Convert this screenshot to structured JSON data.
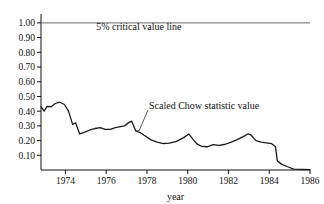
{
  "chart_data": {
    "type": "line",
    "title": "",
    "xlabel": "year",
    "ylabel": "",
    "xlim": [
      1972.8,
      1986.0
    ],
    "ylim": [
      0.0,
      1.04
    ],
    "grid": false,
    "legend_position": "none",
    "xticks": [
      "1974",
      "1976",
      "1978",
      "1980",
      "1982",
      "1984",
      "1986"
    ],
    "xtick_values": [
      1974,
      1976,
      1978,
      1980,
      1982,
      1984,
      1986
    ],
    "yticks": [
      "1.00",
      "0.90",
      "0.80",
      "0.70",
      "0.60",
      "0.50",
      "0.40",
      "0.30",
      "0.20",
      "0.10"
    ],
    "ytick_values": [
      1.0,
      0.9,
      0.8,
      0.7,
      0.6,
      0.5,
      0.4,
      0.3,
      0.2,
      0.1
    ],
    "annotations": [
      {
        "name": "critical-value-annotation",
        "text": "5% critical value line",
        "x": 1977.6,
        "y": 0.955
      },
      {
        "name": "chow-statistic-annotation",
        "text": "Scaled Chow statistic value",
        "x": 1978.1,
        "y": 0.415
      }
    ],
    "series": [
      {
        "name": "5% critical value line",
        "style": "reference",
        "constant_value": 1.0,
        "x": [
          1972.8,
          1986.0
        ],
        "values": [
          1.0,
          1.0
        ]
      },
      {
        "name": "Scaled Chow statistic value",
        "style": "solid",
        "x": [
          1972.8,
          1972.95,
          1973.1,
          1973.3,
          1973.5,
          1973.7,
          1973.95,
          1974.15,
          1974.35,
          1974.5,
          1974.7,
          1974.95,
          1975.2,
          1975.45,
          1975.7,
          1975.95,
          1976.2,
          1976.45,
          1976.7,
          1976.9,
          1977.1,
          1977.25,
          1977.45,
          1977.7,
          1977.95,
          1978.2,
          1978.5,
          1978.8,
          1979.1,
          1979.45,
          1979.8,
          1980.05,
          1980.25,
          1980.45,
          1980.7,
          1980.95,
          1981.25,
          1981.55,
          1981.85,
          1982.1,
          1982.4,
          1982.7,
          1982.95,
          1983.1,
          1983.35,
          1983.6,
          1983.85,
          1984.1,
          1984.3,
          1984.4,
          1984.6,
          1984.9,
          1985.2,
          1986.0
        ],
        "values": [
          0.43,
          0.4,
          0.432,
          0.43,
          0.452,
          0.462,
          0.445,
          0.4,
          0.31,
          0.32,
          0.245,
          0.258,
          0.272,
          0.282,
          0.288,
          0.276,
          0.276,
          0.288,
          0.295,
          0.3,
          0.322,
          0.332,
          0.265,
          0.252,
          0.228,
          0.205,
          0.19,
          0.18,
          0.182,
          0.195,
          0.22,
          0.245,
          0.21,
          0.178,
          0.16,
          0.158,
          0.172,
          0.168,
          0.175,
          0.188,
          0.205,
          0.225,
          0.245,
          0.238,
          0.2,
          0.19,
          0.185,
          0.18,
          0.16,
          0.062,
          0.04,
          0.022,
          0.006,
          0.002
        ]
      }
    ]
  }
}
